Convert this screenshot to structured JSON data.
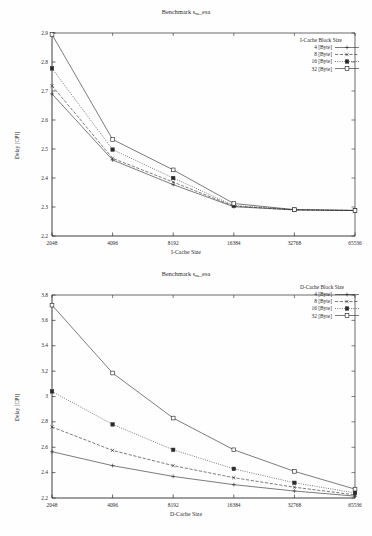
{
  "document": {
    "kind": "two-panel-line-chart-figure"
  },
  "charts": [
    {
      "id": "top",
      "title_main": "Benchmark s",
      "title_sub": "m",
      "title_tail": "_esa",
      "title_full": "Benchmark s_m_esa",
      "xlabel": "I-Cache Size",
      "ylabel": "Delay [CPI]",
      "legend_title": "I-Cache Block Size",
      "xticks": [
        "2048",
        "4096",
        "8192",
        "16384",
        "32768",
        "65536"
      ],
      "yticks": [
        "2.2",
        "2.3",
        "2.4",
        "2.5",
        "2.6",
        "2.7",
        "2.8",
        "2.9"
      ],
      "series": [
        {
          "name": "4 [Byte]",
          "marker": "plus",
          "dash": "solid",
          "values": [
            2.69,
            2.462,
            2.377,
            2.301,
            2.29,
            2.288
          ]
        },
        {
          "name": "8 [Byte]",
          "marker": "cross",
          "dash": "dashed",
          "values": [
            2.718,
            2.468,
            2.386,
            2.303,
            2.29,
            2.288
          ]
        },
        {
          "name": "16 [Byte]",
          "marker": "filled-square",
          "dash": "dotted",
          "values": [
            2.778,
            2.498,
            2.4,
            2.305,
            2.291,
            2.288
          ]
        },
        {
          "name": "32 [Byte]",
          "marker": "open-square",
          "dash": "solid",
          "values": [
            2.895,
            2.533,
            2.428,
            2.312,
            2.291,
            2.288
          ]
        }
      ]
    },
    {
      "id": "bottom",
      "title_main": "Benchmark s",
      "title_sub": "m",
      "title_tail": "_esa",
      "title_full": "Benchmark s_m_esa",
      "xlabel": "D-Cache Size",
      "ylabel": "Delay [CPI]",
      "legend_title": "D-Cache Block Size",
      "xticks": [
        "2048",
        "4096",
        "8192",
        "16384",
        "32768",
        "65536"
      ],
      "yticks": [
        "2.2",
        "2.4",
        "2.6",
        "2.8",
        "3",
        "3.2",
        "3.4",
        "3.6",
        "3.8"
      ],
      "series": [
        {
          "name": "4 [Byte]",
          "marker": "plus",
          "dash": "solid",
          "values": [
            2.565,
            2.455,
            2.37,
            2.305,
            2.255,
            2.215
          ]
        },
        {
          "name": "8 [Byte]",
          "marker": "cross",
          "dash": "dashed",
          "values": [
            2.76,
            2.575,
            2.455,
            2.36,
            2.285,
            2.225
          ]
        },
        {
          "name": "16 [Byte]",
          "marker": "filled-square",
          "dash": "dotted",
          "values": [
            3.04,
            2.78,
            2.58,
            2.43,
            2.32,
            2.24
          ]
        },
        {
          "name": "32 [Byte]",
          "marker": "open-square",
          "dash": "solid",
          "values": [
            3.72,
            3.185,
            2.83,
            2.58,
            2.41,
            2.27
          ]
        }
      ]
    }
  ],
  "chart_data": [
    {
      "type": "line",
      "title": "Benchmark s_m_esa",
      "xlabel": "I-Cache Size",
      "ylabel": "Delay [CPI]",
      "legend_title": "I-Cache Block Size",
      "legend_position": "top-right-inside",
      "grid": false,
      "x": [
        2048,
        4096,
        8192,
        16384,
        32768,
        65536
      ],
      "xtick_labels": [
        "2048",
        "4096",
        "8192",
        "16384",
        "32768",
        "65536"
      ],
      "xscale": "categorical-log2",
      "ylim": [
        2.2,
        2.9
      ],
      "ytick_labels": [
        "2.2",
        "2.3",
        "2.4",
        "2.5",
        "2.6",
        "2.7",
        "2.8",
        "2.9"
      ],
      "series": [
        {
          "name": "4 [Byte]",
          "values": [
            2.69,
            2.462,
            2.377,
            2.301,
            2.29,
            2.288
          ]
        },
        {
          "name": "8 [Byte]",
          "values": [
            2.718,
            2.468,
            2.386,
            2.303,
            2.29,
            2.288
          ]
        },
        {
          "name": "16 [Byte]",
          "values": [
            2.778,
            2.498,
            2.4,
            2.305,
            2.291,
            2.288
          ]
        },
        {
          "name": "32 [Byte]",
          "values": [
            2.895,
            2.533,
            2.428,
            2.312,
            2.291,
            2.288
          ]
        }
      ]
    },
    {
      "type": "line",
      "title": "Benchmark s_m_esa",
      "xlabel": "D-Cache Size",
      "ylabel": "Delay [CPI]",
      "legend_title": "D-Cache Block Size",
      "legend_position": "top-right-inside",
      "grid": false,
      "x": [
        2048,
        4096,
        8192,
        16384,
        32768,
        65536
      ],
      "xtick_labels": [
        "2048",
        "4096",
        "8192",
        "16384",
        "32768",
        "65536"
      ],
      "xscale": "categorical-log2",
      "ylim": [
        2.2,
        3.8
      ],
      "ytick_labels": [
        "2.2",
        "2.4",
        "2.6",
        "2.8",
        "3",
        "3.2",
        "3.4",
        "3.6",
        "3.8"
      ],
      "series": [
        {
          "name": "4 [Byte]",
          "values": [
            2.565,
            2.455,
            2.37,
            2.305,
            2.255,
            2.215
          ]
        },
        {
          "name": "8 [Byte]",
          "values": [
            2.76,
            2.575,
            2.455,
            2.36,
            2.285,
            2.225
          ]
        },
        {
          "name": "16 [Byte]",
          "values": [
            3.04,
            2.78,
            2.58,
            2.43,
            2.32,
            2.24
          ]
        },
        {
          "name": "32 [Byte]",
          "values": [
            3.72,
            3.185,
            2.83,
            2.58,
            2.41,
            2.27
          ]
        }
      ]
    }
  ]
}
